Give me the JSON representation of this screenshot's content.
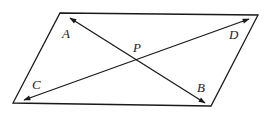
{
  "diagram": {
    "plane": {
      "corners": [
        [
          60,
          13
        ],
        [
          258,
          15
        ],
        [
          211,
          106
        ],
        [
          13,
          103
        ]
      ]
    },
    "point_p": {
      "label": "P",
      "x": 135,
      "y": 60
    },
    "lines": [
      {
        "name": "AB",
        "from": [
          70,
          18
        ],
        "to": [
          205,
          103
        ],
        "arrows": "both"
      },
      {
        "name": "CD",
        "from": [
          24,
          100
        ],
        "to": [
          249,
          19
        ],
        "arrows": "both"
      }
    ],
    "labels": {
      "A": {
        "text": "A",
        "x": 62,
        "y": 38
      },
      "B": {
        "text": "B",
        "x": 197,
        "y": 92
      },
      "C": {
        "text": "C",
        "x": 32,
        "y": 89
      },
      "D": {
        "text": "D",
        "x": 229,
        "y": 39
      },
      "P": {
        "text": "P",
        "x": 133,
        "y": 52
      }
    },
    "colors": {
      "stroke": "#1a1a1a",
      "background": "#ffffff"
    }
  }
}
